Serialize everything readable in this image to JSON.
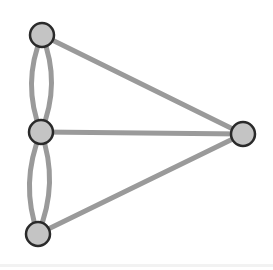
{
  "diagram": {
    "type": "multigraph",
    "colors": {
      "background": "#ffffff",
      "edge": "#9a9a9a",
      "node_fill": "#c4c4c4",
      "node_stroke": "#2a2a2a"
    },
    "edge_width": 5,
    "node_radius": 12,
    "nodes": [
      {
        "id": "top",
        "x": 42,
        "y": 35
      },
      {
        "id": "middle",
        "x": 41,
        "y": 132
      },
      {
        "id": "bottom",
        "x": 38,
        "y": 234
      },
      {
        "id": "right",
        "x": 243,
        "y": 134
      }
    ],
    "edges": [
      {
        "from": "top",
        "to": "middle",
        "curve": "left"
      },
      {
        "from": "top",
        "to": "middle",
        "curve": "right"
      },
      {
        "from": "middle",
        "to": "bottom",
        "curve": "left"
      },
      {
        "from": "middle",
        "to": "bottom",
        "curve": "right"
      },
      {
        "from": "top",
        "to": "right",
        "curve": "straight"
      },
      {
        "from": "middle",
        "to": "right",
        "curve": "straight"
      },
      {
        "from": "bottom",
        "to": "right",
        "curve": "straight"
      }
    ]
  }
}
